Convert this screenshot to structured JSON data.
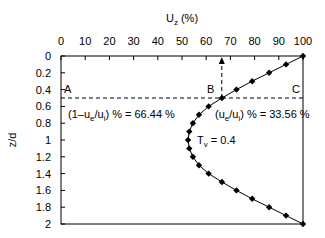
{
  "chart_data": {
    "type": "line",
    "title": "",
    "xlabel": "U_z (%)",
    "ylabel": "z/d",
    "xlim": [
      0,
      100
    ],
    "ylim": [
      2,
      0
    ],
    "x_axis_position": "top",
    "y_inverted": true,
    "xticks": [
      0,
      10,
      20,
      30,
      40,
      50,
      60,
      70,
      80,
      90,
      100
    ],
    "yticks": [
      0,
      0.2,
      0.4,
      0.6,
      0.8,
      1,
      1.2,
      1.4,
      1.6,
      1.8,
      2
    ],
    "grid": false,
    "series": [
      {
        "name": "Tv = 0.4",
        "marker": "diamond",
        "points": [
          {
            "z": 0.0,
            "u": 100
          },
          {
            "z": 0.1,
            "u": 93
          },
          {
            "z": 0.2,
            "u": 86
          },
          {
            "z": 0.3,
            "u": 79
          },
          {
            "z": 0.4,
            "u": 72.5
          },
          {
            "z": 0.5,
            "u": 66.5
          },
          {
            "z": 0.6,
            "u": 61
          },
          {
            "z": 0.7,
            "u": 57
          },
          {
            "z": 0.8,
            "u": 54.5
          },
          {
            "z": 0.9,
            "u": 53
          },
          {
            "z": 1.0,
            "u": 52.5
          },
          {
            "z": 1.1,
            "u": 53
          },
          {
            "z": 1.2,
            "u": 54.5
          },
          {
            "z": 1.3,
            "u": 57
          },
          {
            "z": 1.4,
            "u": 61
          },
          {
            "z": 1.5,
            "u": 66.5
          },
          {
            "z": 1.6,
            "u": 72.5
          },
          {
            "z": 1.7,
            "u": 79
          },
          {
            "z": 1.8,
            "u": 86
          },
          {
            "z": 1.9,
            "u": 93
          },
          {
            "z": 2.0,
            "u": 100
          }
        ]
      }
    ],
    "reference_lines": {
      "horizontal_dashed_z": 0.5,
      "vertical_dashed_arrow_u": 66.44
    },
    "annotations": [
      {
        "text": "A",
        "u": 1,
        "z": 0.45
      },
      {
        "text": "B",
        "u": 60.5,
        "z": 0.45
      },
      {
        "text": "C",
        "u": 96,
        "z": 0.45
      },
      {
        "text": "(1−u_e/u_i) % = 66.44 %",
        "u": 2,
        "z": 0.72
      },
      {
        "text": "(u_e/u_i) % = 33.56 %",
        "u": 64,
        "z": 0.72
      },
      {
        "text": "T_v = 0.4",
        "u": 55,
        "z": 0.97
      }
    ]
  },
  "labels": {
    "xlabel_main": "U",
    "xlabel_sub": "z",
    "xlabel_unit": " (%)",
    "ylabel": "z/d",
    "point_a": "A",
    "point_b": "B",
    "point_c": "C",
    "left_note_pre": "(1–u",
    "left_note_sub1": "e",
    "left_note_mid": "/u",
    "left_note_sub2": "i",
    "left_note_post": ") % = 66.44 %",
    "right_note_pre": "(u",
    "right_note_sub1": "e",
    "right_note_mid": "/u",
    "right_note_sub2": "i",
    "right_note_post": ") % = 33.56 %",
    "tv_main": "T",
    "tv_sub": "v",
    "tv_post": " = 0.4"
  }
}
